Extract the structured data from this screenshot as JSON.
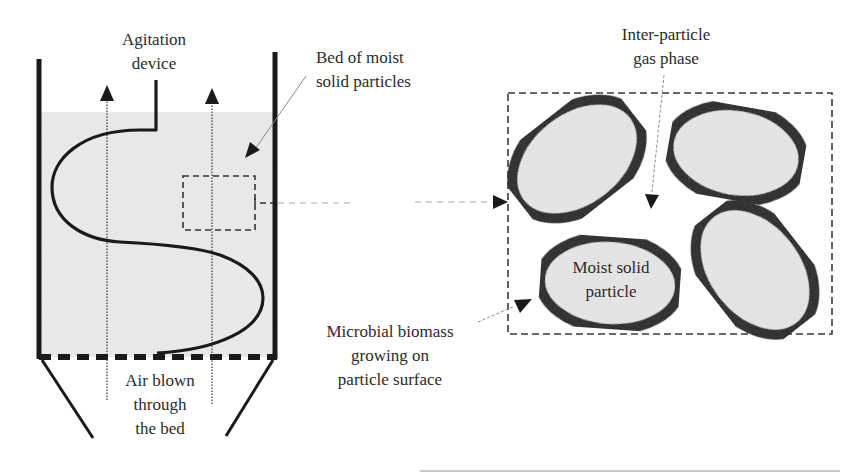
{
  "diagram": {
    "type": "solid-state fermentation bioreactor schematic",
    "colors": {
      "wall": "#1a1a1a",
      "bed_fill": "#ebebeb",
      "particle_fill": "#e6e6e6",
      "particle_outline": "#151515",
      "dashed": "#3a3a3a",
      "leader": "#8a8a8a"
    },
    "labels": {
      "agitation": [
        "Agitation",
        "device"
      ],
      "bed": [
        "Bed of moist",
        "solid particles"
      ],
      "air": [
        "Air blown",
        "through",
        "the bed"
      ],
      "gas_phase": [
        "Inter-particle",
        "gas phase"
      ],
      "particle": [
        "Moist solid",
        "particle"
      ],
      "biomass": [
        "Microbial biomass",
        "growing on",
        "particle surface"
      ]
    },
    "components": {
      "left_vessel": "packed bed with agitation device and perforated base",
      "zoom_region": "dashed inset box linked by dashed arrow to magnified view",
      "magnified_view": "four ellipsoidal moist solid particles with dark biomass outlines"
    }
  }
}
